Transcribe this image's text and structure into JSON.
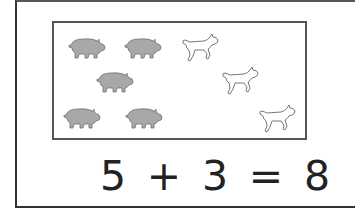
{
  "scene": {
    "pigs": [
      {
        "x": 13,
        "y": 13
      },
      {
        "x": 69,
        "y": 13
      },
      {
        "x": 41,
        "y": 47
      },
      {
        "x": 8,
        "y": 83
      },
      {
        "x": 70,
        "y": 83
      }
    ],
    "lambs": [
      {
        "x": 126,
        "y": 9
      },
      {
        "x": 166,
        "y": 42
      },
      {
        "x": 203,
        "y": 80
      }
    ],
    "pig_count": 5,
    "lamb_count": 3
  },
  "equation": {
    "a": "5",
    "op": "+",
    "b": "3",
    "eq": "=",
    "result": "8"
  },
  "colors": {
    "pig_fill": "#a8a8a8",
    "pig_stroke": "#6e6e6e",
    "lamb_fill": "#ffffff",
    "lamb_stroke": "#777777",
    "border": "#444444"
  }
}
